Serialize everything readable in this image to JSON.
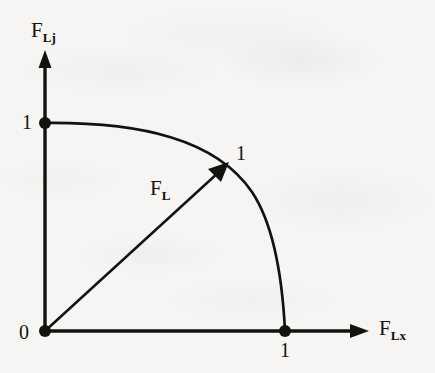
{
  "figure": {
    "type": "diagram",
    "background_color": "#f6f5f3",
    "ink_color": "#14120f"
  },
  "axes": {
    "x": {
      "label_base": "F",
      "label_sub": "Lx",
      "arrow": "right-arrow-icon",
      "origin_px": [
        45,
        331
      ],
      "tip_px": [
        368,
        331
      ],
      "ticks": [
        {
          "value": "1",
          "position_px": [
            285,
            331
          ],
          "marker": "filled-dot"
        }
      ]
    },
    "y": {
      "label_base": "F",
      "label_sub": "Lj",
      "arrow": "up-arrow-icon",
      "origin_px": [
        45,
        331
      ],
      "tip_px": [
        45,
        52
      ],
      "ticks": [
        {
          "value": "1",
          "position_px": [
            45,
            123
          ],
          "marker": "filled-dot"
        }
      ]
    },
    "origin_label": "0"
  },
  "curve": {
    "name": "interaction-curve",
    "from_px": [
      45,
      123
    ],
    "to_px": [
      285,
      331
    ],
    "through_px": [
      230,
      162
    ],
    "style": "solid",
    "stroke_width": 2.6
  },
  "vector": {
    "label_base": "F",
    "label_sub": "L",
    "from_px": [
      45,
      331
    ],
    "to_px": [
      227,
      164
    ],
    "head": "arrowhead-icon",
    "tip_value": "1"
  },
  "labels": {
    "y_axis_name": "F",
    "y_axis_sub": "Lj",
    "x_axis_name": "F",
    "x_axis_sub": "Lx",
    "vector_name": "F",
    "vector_sub": "L",
    "origin": "0",
    "y_tick_one": "1",
    "x_tick_one": "1",
    "vector_tip_one": "1"
  }
}
